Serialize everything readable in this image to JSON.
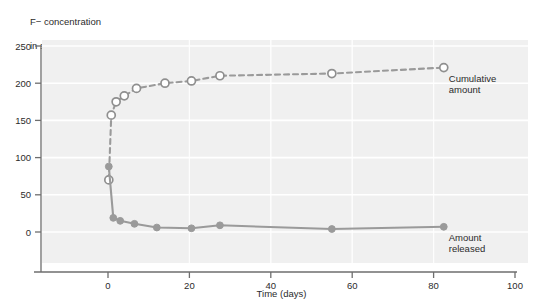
{
  "figure": {
    "y_axis_title_line1": "F− concentration",
    "y_axis_title_line2": "in solution (ppm)",
    "x_axis_title": "Time (days)"
  },
  "annotations": {
    "cumulative_line1": "Cumulative",
    "cumulative_line2": "amount",
    "released_line1": "Amount",
    "released_line2": "released"
  },
  "colors": {
    "plot_background": "#f0f0f0",
    "gridline": "#ffffff",
    "series_line": "#9a9a9a",
    "marker_fill_released": "#9a9a9a",
    "marker_fill_cumulative": "#ffffff",
    "marker_stroke": "#8f8f8f",
    "axis": "#6e6e6e",
    "text": "#2b2b2b"
  },
  "chart_data": {
    "type": "line",
    "title": "",
    "subtitle": "",
    "xlabel": "Time (days)",
    "ylabel": "F− concentration in solution (ppm)",
    "xlim": [
      -3,
      100
    ],
    "ylim": [
      0,
      250
    ],
    "xticks": [
      0,
      20,
      40,
      60,
      80,
      100
    ],
    "yticks": [
      0,
      50,
      100,
      150,
      200,
      250
    ],
    "xtick_labels": [
      "0",
      "20",
      "40",
      "60",
      "80",
      "100"
    ],
    "ytick_labels": [
      "0",
      "50",
      "100",
      "150",
      "200",
      "250"
    ],
    "grid": true,
    "grid_axis": "y",
    "legend": "inline-annotations",
    "series": [
      {
        "name": "Cumulative amount",
        "linestyle": "dashed",
        "marker": "open-circle",
        "annotation_at": {
          "x": 82.5,
          "y": 221
        },
        "points": [
          {
            "x": 0.2,
            "y": 70
          },
          {
            "x": 0.8,
            "y": 157
          },
          {
            "x": 2.0,
            "y": 175
          },
          {
            "x": 4.0,
            "y": 183
          },
          {
            "x": 7.0,
            "y": 193
          },
          {
            "x": 14.0,
            "y": 200
          },
          {
            "x": 20.5,
            "y": 203
          },
          {
            "x": 27.5,
            "y": 210
          },
          {
            "x": 55.0,
            "y": 213
          },
          {
            "x": 82.5,
            "y": 221
          }
        ]
      },
      {
        "name": "Amount released",
        "linestyle": "solid",
        "marker": "filled-circle",
        "annotation_at": {
          "x": 82.5,
          "y": 7
        },
        "points": [
          {
            "x": 0.2,
            "y": 88
          },
          {
            "x": 1.3,
            "y": 19
          },
          {
            "x": 3.0,
            "y": 15
          },
          {
            "x": 6.5,
            "y": 11
          },
          {
            "x": 12.0,
            "y": 6
          },
          {
            "x": 20.5,
            "y": 5
          },
          {
            "x": 27.5,
            "y": 9
          },
          {
            "x": 55.0,
            "y": 4
          },
          {
            "x": 82.5,
            "y": 7
          }
        ]
      }
    ]
  }
}
